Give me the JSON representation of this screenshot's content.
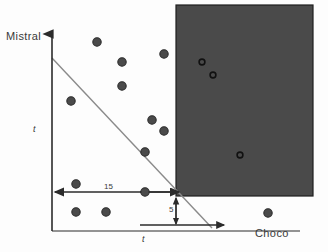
{
  "figure": {
    "title": "",
    "background_color": "#fdfdfd",
    "region_color": "#4a4a4a",
    "axis_color": "#2b2b2b",
    "boundary_line_color": "#7a7a7a",
    "point_fill_color": "#4a4a4a",
    "point_stroke_color": "#2b2b2b"
  },
  "labels": {
    "y_axis_title": "Mistral",
    "x_axis_title": "Choco",
    "y_axis_tick": "t",
    "x_axis_tick": "t",
    "horizontal_measure": "15",
    "vertical_measure": "5"
  },
  "chart_data": {
    "type": "scatter",
    "title": "",
    "xlabel": "Choco",
    "ylabel": "Mistral",
    "grid": false,
    "legend": false,
    "xlim": [
      0,
      328
    ],
    "ylim": [
      0,
      252
    ],
    "series": [
      {
        "name": "filled-points",
        "marker": "filled-circle",
        "points": [
          {
            "x": 97,
            "y": 42
          },
          {
            "x": 164,
            "y": 54
          },
          {
            "x": 122,
            "y": 62
          },
          {
            "x": 122,
            "y": 86
          },
          {
            "x": 71,
            "y": 101
          },
          {
            "x": 152,
            "y": 120
          },
          {
            "x": 164,
            "y": 131
          },
          {
            "x": 145,
            "y": 152
          },
          {
            "x": 76,
            "y": 184
          },
          {
            "x": 145,
            "y": 192
          },
          {
            "x": 76,
            "y": 212
          },
          {
            "x": 106,
            "y": 212
          },
          {
            "x": 268,
            "y": 213
          }
        ]
      },
      {
        "name": "open-points",
        "marker": "open-circle",
        "points": [
          {
            "x": 202,
            "y": 62
          },
          {
            "x": 213,
            "y": 75
          },
          {
            "x": 240,
            "y": 155
          }
        ]
      }
    ],
    "shaded_region": {
      "name": "highlighted-quadrant",
      "x": 176,
      "y": 5,
      "width": 137,
      "height": 191,
      "fill": "#4a4a4a"
    },
    "boundary_line": {
      "name": "decision-boundary",
      "x1": 52,
      "y1": 58,
      "x2": 212,
      "y2": 228
    },
    "axes": {
      "y_axis": {
        "x": 52,
        "y_top": 31,
        "y_bottom": 231
      },
      "x_axis": {
        "y": 231,
        "x_left": 52,
        "x_right": 300
      }
    },
    "annotations": [
      {
        "label": "15",
        "type": "horizontal-arrow",
        "x1": 55,
        "x2": 176,
        "y": 192
      },
      {
        "label": "5",
        "type": "vertical-arrow",
        "x": 176,
        "y1": 196,
        "y2": 225
      },
      {
        "label": "",
        "type": "horizontal-arrow-bottom",
        "x1": 140,
        "x2": 225,
        "y": 225
      }
    ]
  }
}
